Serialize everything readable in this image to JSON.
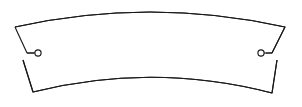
{
  "drawing": {
    "title": "Curved Arc Segment",
    "canvas": {
      "width": 302,
      "height": 107,
      "background_color": "#ffffff"
    },
    "style": {
      "line_color": "#1a1a1a",
      "line_width": 1.15,
      "fill_color": "#ffffff"
    },
    "geometry": {
      "top_arc": {
        "start": [
          15,
          27
        ],
        "end": [
          285,
          27
        ],
        "apex": [
          150,
          12
        ],
        "path": "M 15 27 Q 150 -3 285 27"
      },
      "bottom_arc": {
        "start": [
          33,
          92
        ],
        "end": [
          272,
          93
        ],
        "apex": [
          152,
          77
        ],
        "path": "M 33 92 Q 152 62 272 93"
      },
      "left_end": {
        "upper_edge_start": [
          15,
          27
        ],
        "upper_edge_end": [
          27,
          53
        ],
        "notch_stub_end": [
          34,
          53
        ],
        "lower_edge_start": [
          23,
          60
        ],
        "lower_edge_end": [
          33,
          92
        ],
        "hole_center": [
          38,
          53
        ],
        "hole_radius": 3.1
      },
      "right_end": {
        "upper_edge_start": [
          285,
          27
        ],
        "upper_edge_end": [
          272,
          53
        ],
        "notch_stub_end": [
          266,
          53
        ],
        "lower_edge_start": [
          277,
          60
        ],
        "lower_edge_end": [
          272,
          93
        ],
        "hole_center": [
          261,
          53
        ],
        "hole_radius": 3.1
      },
      "outline_path": "M 15 27 Q 150 -3 285 27 L 272 53 L 266 53 M 277 60 L 272 93 Q 152 62 33 92 L 23 60 M 34 53 L 27 53 Z"
    }
  }
}
